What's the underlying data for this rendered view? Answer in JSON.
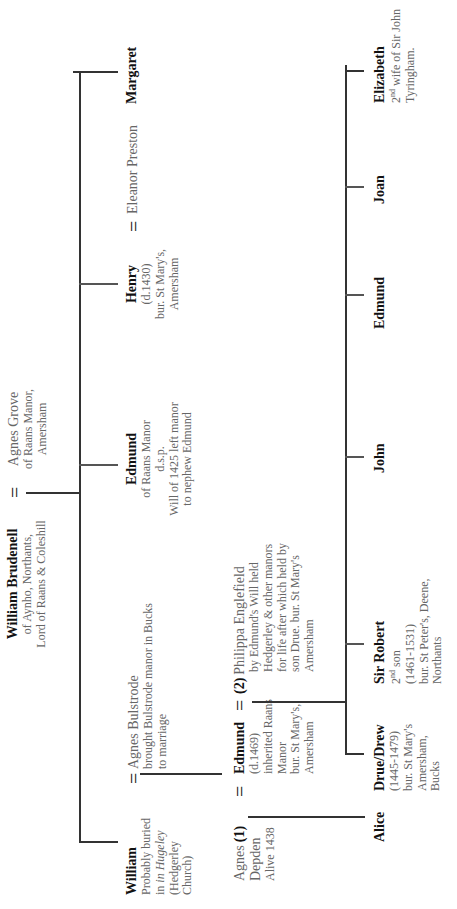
{
  "root": {
    "name": "William Brudenell",
    "lines": [
      "of Aynho, Northants,",
      "Lord of Raans & Coleshill"
    ]
  },
  "root_spouse": {
    "name": "Agnes Grove",
    "lines": [
      "of Raans Manor,",
      "Amersham"
    ]
  },
  "marriage_symbol": "=",
  "generation1": {
    "william": {
      "name": "William",
      "lines": [
        "Probably buried",
        "in Hugeley",
        "(Hedgerley",
        "Church)"
      ]
    },
    "william_spouse": {
      "name": "Agnes Bulstrode",
      "lines": [
        "brought Bulstrode manor in Bucks",
        "to marriage"
      ]
    },
    "edmund": {
      "name": "Edmund",
      "lines": [
        "of Raans Manor",
        "d.s.p.",
        "Will of 1425 left manor",
        "to nephew Edmund"
      ]
    },
    "henry": {
      "name": "Henry",
      "lines": [
        "(d.1430)",
        "bur. St Mary's,",
        "Amersham"
      ]
    },
    "henry_spouse": {
      "name": "Eleanor Preston"
    },
    "margaret": {
      "name": "Margaret"
    }
  },
  "generation2": {
    "agnes_depden": {
      "name": "Agnes",
      "marker": "(1)",
      "lines": [
        "Depden",
        "Alive 1438"
      ]
    },
    "edmund": {
      "name": "Edmund",
      "lines": [
        "(d.1469)",
        "inherited Raans",
        "Manor",
        "bur. St Mary's,",
        "Amersham"
      ]
    },
    "philippa": {
      "marker": "(2)",
      "name": "Philippa Englefield",
      "lines": [
        "by Edmund's Will held",
        "Hedgerley & other manors",
        "for life after which held by",
        "son Drue. bur. St Mary's",
        "Amersham"
      ]
    }
  },
  "generation3": {
    "alice": {
      "name": "Alice"
    },
    "drue": {
      "name": "Drue/Drew",
      "lines": [
        "(1445-1479)",
        "bur. St Mary's",
        "Amersham,",
        "Bucks"
      ]
    },
    "robert": {
      "name": "Sir Robert",
      "ordinal": "2",
      "ordinal_sup": "nd",
      "ordinal_rest": " son",
      "lines": [
        "(1461-1531)",
        "bur. St Peter's, Deene,",
        "Northants"
      ]
    },
    "john": {
      "name": "John"
    },
    "edmund": {
      "name": "Edmund"
    },
    "joan": {
      "name": "Joan"
    },
    "elizabeth": {
      "name": "Elizabeth",
      "ordinal": "2",
      "ordinal_sup": "nd",
      "ordinal_rest": " wife of Sir John",
      "lines": [
        "Tyringham."
      ]
    }
  }
}
